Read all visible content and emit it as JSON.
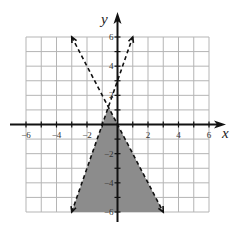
{
  "chart_data": {
    "type": "inequality-graph",
    "title": "",
    "xlabel": "x",
    "ylabel": "y",
    "xlim": [
      -6,
      6
    ],
    "ylim": [
      -6,
      6
    ],
    "grid": true,
    "grid_step": 1,
    "x_tick_labels": [
      "-6",
      "-4",
      "-2",
      "2",
      "4",
      "6"
    ],
    "x_tick_values": [
      -6,
      -4,
      -2,
      2,
      4,
      6
    ],
    "y_tick_labels": [
      "6",
      "4",
      "2",
      "-2",
      "-4",
      "-6"
    ],
    "y_tick_values": [
      6,
      4,
      2,
      -2,
      -4,
      -6
    ],
    "boundary_lines": [
      {
        "name": "line-a",
        "equation": "y = 3x + 3",
        "style": "dashed",
        "endpoints": [
          [
            -3,
            -6
          ],
          [
            1,
            6
          ]
        ]
      },
      {
        "name": "line-b",
        "equation": "y = -2x",
        "style": "dashed",
        "endpoints": [
          [
            -3,
            6
          ],
          [
            3,
            -6
          ]
        ]
      }
    ],
    "shaded_region": {
      "description": "Region below both dashed lines (y < 3x+3 and y < -2x)",
      "vertices": [
        [
          -0.6,
          1.2
        ],
        [
          -3,
          -6
        ],
        [
          3,
          -6
        ]
      ],
      "color": "#8c8c8c"
    },
    "colors": {
      "grid": "#b5b5b5",
      "axes": "#111111",
      "lines": "#111111",
      "shade": "#8c8c8c"
    }
  }
}
